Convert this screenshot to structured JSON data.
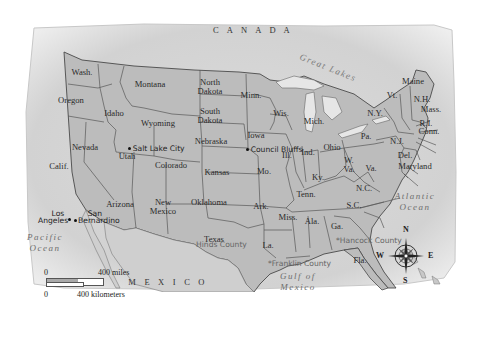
{
  "map": {
    "title": "United States",
    "colors": {
      "land": "#b9b9b9",
      "water": "#ececec",
      "border": "#555555",
      "paper": "#f4f4f4"
    },
    "countries": [
      {
        "id": "canada",
        "label": "C A N A D A",
        "x": 253,
        "y": 30
      },
      {
        "id": "mexico",
        "label": "M E X I C O",
        "x": 168,
        "y": 282
      }
    ],
    "waters": [
      {
        "id": "pacific",
        "label": "Pacific\nOcean",
        "x": 45,
        "y": 243
      },
      {
        "id": "atlantic",
        "label": "Atlantic\nOcean",
        "x": 415,
        "y": 202
      },
      {
        "id": "gulf",
        "label": "Gulf of\nMexico",
        "x": 298,
        "y": 282
      },
      {
        "id": "great-lakes",
        "label": "Great Lakes",
        "x": 328,
        "y": 68
      }
    ],
    "states": [
      {
        "id": "wash",
        "label": "Wash.",
        "x": 82,
        "y": 72
      },
      {
        "id": "oregon",
        "label": "Oregon",
        "x": 71,
        "y": 100
      },
      {
        "id": "calif",
        "label": "Calif.",
        "x": 59,
        "y": 166
      },
      {
        "id": "idaho",
        "label": "Idaho",
        "x": 114,
        "y": 113
      },
      {
        "id": "nevada",
        "label": "Nevada",
        "x": 85,
        "y": 147
      },
      {
        "id": "montana",
        "label": "Montana",
        "x": 150,
        "y": 84
      },
      {
        "id": "wyoming",
        "label": "Wyoming",
        "x": 158,
        "y": 123
      },
      {
        "id": "utah",
        "label": "Utah",
        "x": 127,
        "y": 156
      },
      {
        "id": "colorado",
        "label": "Colorado",
        "x": 171,
        "y": 165
      },
      {
        "id": "arizona",
        "label": "Arizona",
        "x": 120,
        "y": 204
      },
      {
        "id": "new-mexico",
        "label": "New\nMexico",
        "x": 163,
        "y": 207
      },
      {
        "id": "north-dakota",
        "label": "North\nDakota",
        "x": 210,
        "y": 87
      },
      {
        "id": "south-dakota",
        "label": "South\nDakota",
        "x": 210,
        "y": 116
      },
      {
        "id": "nebraska",
        "label": "Nebraska",
        "x": 211,
        "y": 141
      },
      {
        "id": "kansas",
        "label": "Kansas",
        "x": 217,
        "y": 172
      },
      {
        "id": "oklahoma",
        "label": "Oklahoma",
        "x": 209,
        "y": 202
      },
      {
        "id": "texas",
        "label": "Texas",
        "x": 214,
        "y": 239
      },
      {
        "id": "minn",
        "label": "Minn.",
        "x": 251,
        "y": 95
      },
      {
        "id": "iowa",
        "label": "Iowa",
        "x": 256,
        "y": 135
      },
      {
        "id": "mo",
        "label": "Mo.",
        "x": 264,
        "y": 171
      },
      {
        "id": "ark",
        "label": "Ark.",
        "x": 261,
        "y": 206
      },
      {
        "id": "la",
        "label": "La.",
        "x": 268,
        "y": 245
      },
      {
        "id": "wis",
        "label": "Wis.",
        "x": 281,
        "y": 113
      },
      {
        "id": "ill",
        "label": "Ill.",
        "x": 287,
        "y": 155
      },
      {
        "id": "mich",
        "label": "Mich.",
        "x": 314,
        "y": 121
      },
      {
        "id": "ind",
        "label": "Ind.",
        "x": 308,
        "y": 152
      },
      {
        "id": "ohio",
        "label": "Ohio",
        "x": 332,
        "y": 147
      },
      {
        "id": "ky",
        "label": "Ky.",
        "x": 318,
        "y": 177
      },
      {
        "id": "tenn",
        "label": "Tenn.",
        "x": 306,
        "y": 194
      },
      {
        "id": "miss",
        "label": "Miss.",
        "x": 288,
        "y": 217
      },
      {
        "id": "ala",
        "label": "Ala.",
        "x": 312,
        "y": 221
      },
      {
        "id": "ga",
        "label": "Ga.",
        "x": 337,
        "y": 226
      },
      {
        "id": "fla",
        "label": "Fla.",
        "x": 360,
        "y": 260
      },
      {
        "id": "sc",
        "label": "S.C.",
        "x": 354,
        "y": 205
      },
      {
        "id": "nc",
        "label": "N.C.",
        "x": 364,
        "y": 188
      },
      {
        "id": "w-va",
        "label": "W.\nVa.",
        "x": 349,
        "y": 165
      },
      {
        "id": "va",
        "label": "Va.",
        "x": 371,
        "y": 168
      },
      {
        "id": "pa",
        "label": "Pa.",
        "x": 366,
        "y": 136
      },
      {
        "id": "ny",
        "label": "N.Y.",
        "x": 375,
        "y": 113
      },
      {
        "id": "vt",
        "label": "Vt.",
        "x": 392,
        "y": 95
      },
      {
        "id": "maine",
        "label": "Maine",
        "x": 413,
        "y": 81
      },
      {
        "id": "nh",
        "label": "N.H.",
        "x": 422,
        "y": 99
      },
      {
        "id": "mass",
        "label": "Mass.",
        "x": 431,
        "y": 109
      },
      {
        "id": "ri",
        "label": "R.I.",
        "x": 426,
        "y": 123
      },
      {
        "id": "conn",
        "label": "Conn.",
        "x": 429,
        "y": 131
      },
      {
        "id": "nj",
        "label": "N.J.",
        "x": 397,
        "y": 141
      },
      {
        "id": "del",
        "label": "Del.",
        "x": 405,
        "y": 155
      },
      {
        "id": "maryland",
        "label": "Maryland",
        "x": 415,
        "y": 166
      }
    ],
    "cities": [
      {
        "id": "salt-lake-city",
        "label": "Salt Lake City",
        "x": 122,
        "y": 141
      },
      {
        "id": "council-bluffs",
        "label": "Council Bluffs",
        "x": 239,
        "y": 142
      },
      {
        "id": "los-angeles",
        "label": "Los\nAngeles",
        "x": 35,
        "y": 179,
        "dot_x": 68,
        "dot_y": 197
      },
      {
        "id": "san-bernardino",
        "label": "San\nBernardino",
        "x": 76,
        "y": 184,
        "dot_x": 74,
        "dot_y": 198
      }
    ],
    "counties": [
      {
        "id": "hinds-county",
        "label": "Hinds County",
        "x": 218,
        "y": 224
      },
      {
        "id": "franklin-county",
        "label": "Franklin County",
        "x": 277,
        "y": 237
      },
      {
        "id": "hancock-county",
        "label": "Hancock County",
        "x": 340,
        "y": 215
      }
    ],
    "scale": {
      "miles_start": "0",
      "miles_end": "400 miles",
      "km_start": "0",
      "km_end": "400 kilometers"
    },
    "compass": {
      "n": "N",
      "s": "S",
      "e": "E",
      "w": "W"
    }
  }
}
